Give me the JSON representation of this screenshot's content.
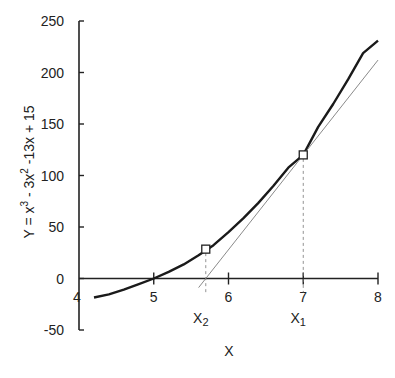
{
  "chart_data": {
    "type": "line",
    "title": "",
    "xlabel": "X",
    "ylabel": "Y = x³ - 3x² -13x + 15",
    "ylabel_parts": {
      "pre": "Y = x",
      "sup1": "3",
      "mid": " - 3x",
      "sup2": "2",
      "post": " -13x + 15"
    },
    "xlim": [
      4,
      8
    ],
    "ylim": [
      -50,
      250
    ],
    "x_ticks": [
      4,
      5,
      6,
      7,
      8
    ],
    "y_ticks": [
      -50,
      0,
      50,
      100,
      150,
      200,
      250
    ],
    "grid": false,
    "series": [
      {
        "name": "f(x) = x^3 - 3x^2 - 13x + 15",
        "style": "solid-thick",
        "color": "#1a1a1a",
        "x": [
          4.2,
          4.4,
          4.6,
          4.8,
          5.0,
          5.2,
          5.4,
          5.6,
          5.8,
          6.0,
          6.2,
          6.4,
          6.6,
          6.8,
          7.0,
          7.2,
          7.4,
          7.6,
          7.8,
          8.0
        ],
        "values": [
          -18.4,
          -15.3,
          -10.8,
          -5.5,
          0,
          6.5,
          13.7,
          22.5,
          32.3,
          45,
          58.5,
          73.4,
          89.8,
          107.6,
          120,
          147.2,
          169.4,
          193.3,
          218.8,
          231
        ]
      },
      {
        "name": "tangent at x1",
        "style": "solid-thin",
        "color": "#8a8a8a",
        "x": [
          5.6,
          8.0
        ],
        "values": [
          -8.8,
          212
        ]
      }
    ],
    "markers": [
      {
        "label": "X1",
        "label_main": "X",
        "label_sub": "1",
        "x": 7.0,
        "y": 120
      },
      {
        "label": "X2",
        "label_main": "X",
        "label_sub": "2",
        "x": 5.696,
        "y": 28.5
      }
    ],
    "annotations": [
      "X1",
      "X2"
    ]
  }
}
